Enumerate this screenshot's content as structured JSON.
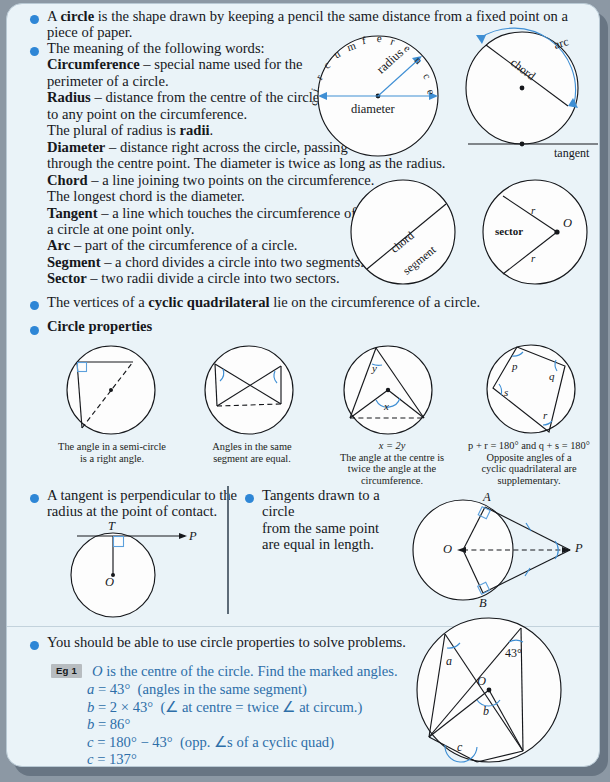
{
  "colors": {
    "bullet": "#2e86d6",
    "accent": "#3f8fd4",
    "panel_bg": "#eaf3f8",
    "eg_text": "#2d6ea8"
  },
  "sections": {
    "s1": {
      "line1_a": "A ",
      "line1_b": "circle",
      "line1_c": " is the shape drawn by keeping a pencil the same distance from a fixed point on a",
      "line2": "piece of paper."
    },
    "s2": {
      "intro": "The meaning of the following words:",
      "terms": [
        {
          "term": "Circumference",
          "rest": " – special name used for the"
        },
        {
          "term": "",
          "rest": "perimeter of a circle."
        },
        {
          "term": "Radius",
          "rest": " – distance from the centre of the circle"
        },
        {
          "term": "",
          "rest": "to any point on the circumference."
        },
        {
          "term": "",
          "rest": "The plural of radius is "
        },
        {
          "term": "Diameter",
          "rest": " – distance right across the circle, passing"
        },
        {
          "term": "",
          "rest": "through the centre point. The diameter is twice as long as the radius."
        },
        {
          "term": "Chord",
          "rest": " – a line joining two points on the circumference."
        },
        {
          "term": "",
          "rest": "The longest chord is the diameter."
        },
        {
          "term": "Tangent",
          "rest": " – a line which touches the circumference of"
        },
        {
          "term": "",
          "rest": "a circle at one point only."
        },
        {
          "term": "Arc",
          "rest": " – part of the circumference of a circle."
        },
        {
          "term": "Segment",
          "rest": " – a chord divides a circle into two segments."
        },
        {
          "term": "Sector",
          "rest": " – two radii divide a circle into two sectors."
        }
      ],
      "radii_word": "radii",
      "radii_tail": "."
    },
    "s3": {
      "a": "The vertices of a ",
      "b": "cyclic quadrilateral",
      "c": " lie on the circumference of a circle."
    },
    "s4": {
      "heading": "Circle properties"
    },
    "s5": {
      "line1": "A tangent is perpendicular to the",
      "line2": "radius at the point of contact."
    },
    "s6": {
      "line1": "Tangents drawn to a circle",
      "line2": "from the same point",
      "line3": "are equal in length."
    },
    "s7": {
      "line1": "You should be able to use circle properties to solve problems."
    }
  },
  "diagrams": {
    "d1": {
      "name": "circumference-radius-diameter",
      "letters": [
        "c",
        "i",
        "r",
        "c",
        "u",
        "m",
        "f",
        "e",
        "r",
        "e",
        "n",
        "c",
        "e"
      ],
      "label_radius": "radius",
      "label_diameter": "diameter"
    },
    "d2": {
      "name": "chord-arc-tangent",
      "label_arc": "arc",
      "label_chord": "chord",
      "label_tangent": "tangent"
    },
    "d3": {
      "name": "chord-segment",
      "label_chord": "chord",
      "label_segment": "segment"
    },
    "d4": {
      "name": "sector",
      "label_sector": "sector",
      "label_r1": "r",
      "label_r2": "r",
      "label_O": "O"
    },
    "p1": {
      "caption_l1": "The angle in a semi-circle",
      "caption_l2": "is a right angle."
    },
    "p2": {
      "caption_l1": "Angles in the same",
      "caption_l2": "segment are equal."
    },
    "p3": {
      "formula": "x = 2y",
      "label_x": "x",
      "label_y": "y",
      "caption_l1": "The angle at the centre is",
      "caption_l2": "twice the angle at the",
      "caption_l3": "circumference."
    },
    "p4": {
      "formula": "p + r = 180° and q + s = 180°",
      "label_p": "p",
      "label_q": "q",
      "label_r": "r",
      "label_s": "s",
      "caption_l1": "Opposite angles of a",
      "caption_l2": "cyclic quadrilateral are",
      "caption_l3": "supplementary."
    },
    "d5": {
      "name": "tangent-perpendicular-radius",
      "label_T": "T",
      "label_P": "P",
      "label_O": "O"
    },
    "d6": {
      "name": "two-tangents-equal",
      "label_A": "A",
      "label_B": "B",
      "label_O": "O",
      "label_P": "P"
    },
    "d7": {
      "name": "worked-example-circle",
      "label_a": "a",
      "label_b": "b",
      "label_c": "c",
      "label_O": "O",
      "label_angle": "43°"
    }
  },
  "example": {
    "badge": "Eg 1",
    "prompt_O": "O",
    "prompt_rest": " is the centre of the circle. Find the marked angles.",
    "lines": [
      {
        "lhs": "a",
        "eq": " = 43°",
        "note": "(angles in the same segment)"
      },
      {
        "lhs": "b",
        "eq": " = 2 × 43°",
        "note": "(∠ at centre = twice ∠ at circum.)"
      },
      {
        "lhs": "b",
        "eq": " = 86°",
        "note": ""
      },
      {
        "lhs": "c",
        "eq": " = 180° − 43°",
        "note": "(opp. ∠s of a cyclic quad)"
      },
      {
        "lhs": "c",
        "eq": " = 137°",
        "note": ""
      }
    ]
  }
}
